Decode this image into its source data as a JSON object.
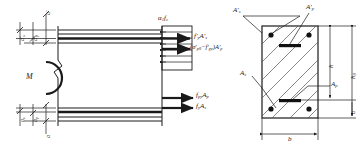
{
  "figure": {
    "type": "engineering-diagram",
    "line_color": "#1a1a1a",
    "hatch_color": "#555555"
  },
  "elevation": {
    "moment_label": "M",
    "top_dims": [
      {
        "name": "a-prime-s",
        "label_html": "a&prime;<sub>s</sub>"
      },
      {
        "name": "a-prime-p",
        "label_html": "a&prime;<sub>p</sub>"
      },
      {
        "name": "a-prime",
        "label_html": "a&prime;"
      }
    ],
    "bottom_dims": [
      {
        "name": "a-s",
        "label_html": "a<sub>s</sub>"
      },
      {
        "name": "a-p",
        "label_html": "a<sub>p</sub>"
      },
      {
        "name": "a",
        "label_html": "a"
      }
    ]
  },
  "stress_block": {
    "stress_label_html": "&alpha;<sub>1</sub>f<sub>c</sub>",
    "forces": [
      {
        "name": "force-compression-steel",
        "label_html": "f&prime;<sub>y</sub>A&prime;<sub>s</sub>"
      },
      {
        "name": "force-compression-tendon",
        "label_html": "(&sigma;&prime;<sub>p0</sub>&minus;f&prime;<sub>py</sub>)A&prime;<sub>p</sub>"
      },
      {
        "name": "force-tension-tendon",
        "label_html": "f<sub>py</sub>A<sub>p</sub>"
      },
      {
        "name": "force-tension-steel",
        "label_html": "f<sub>y</sub>A<sub>s</sub>"
      }
    ]
  },
  "section": {
    "top_labels": [
      {
        "name": "area-compression-steel",
        "label_html": "A&prime;<sub>s</sub>"
      },
      {
        "name": "area-compression-tendon",
        "label_html": "A&prime;<sub>p</sub>"
      }
    ],
    "side_labels": [
      {
        "name": "area-tension-steel",
        "label_html": "A<sub>s</sub>"
      },
      {
        "name": "area-tension-tendon",
        "label_html": "A<sub>p</sub>"
      }
    ],
    "dims": [
      {
        "name": "dim-width-b",
        "label_html": "b"
      },
      {
        "name": "dim-height-h",
        "label_html": "h"
      },
      {
        "name": "dim-effective-h0",
        "label_html": "h<sub>0</sub>"
      },
      {
        "name": "dim-cover-a",
        "label_html": "a"
      }
    ]
  }
}
